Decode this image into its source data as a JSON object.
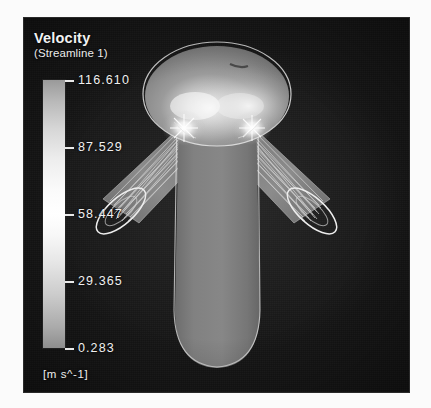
{
  "legend": {
    "title": "Velocity",
    "subtitle": "(Streamline  1)",
    "units": "[m s^-1]",
    "ticks": [
      {
        "value": "116.610",
        "pos": 0.0
      },
      {
        "value": "87.529",
        "pos": 0.25
      },
      {
        "value": "58.447",
        "pos": 0.5
      },
      {
        "value": "29.365",
        "pos": 0.75
      },
      {
        "value": "0.283",
        "pos": 1.0
      }
    ],
    "colormap": "grayscale",
    "max": 116.61,
    "min": 0.283
  },
  "scene": {
    "background_color": "#151515",
    "surface_color": "#7d7d7d",
    "outline_color": "#e6e6e6",
    "streamline_color": "#dcdcdc",
    "highlight_color": "#ffffff",
    "parts": [
      {
        "name": "head-dome"
      },
      {
        "name": "torso-body"
      },
      {
        "name": "left-arm-duct"
      },
      {
        "name": "right-arm-duct"
      },
      {
        "name": "left-outlet-ring"
      },
      {
        "name": "right-outlet-ring"
      },
      {
        "name": "left-shoulder-highlight"
      },
      {
        "name": "right-shoulder-highlight"
      }
    ]
  }
}
